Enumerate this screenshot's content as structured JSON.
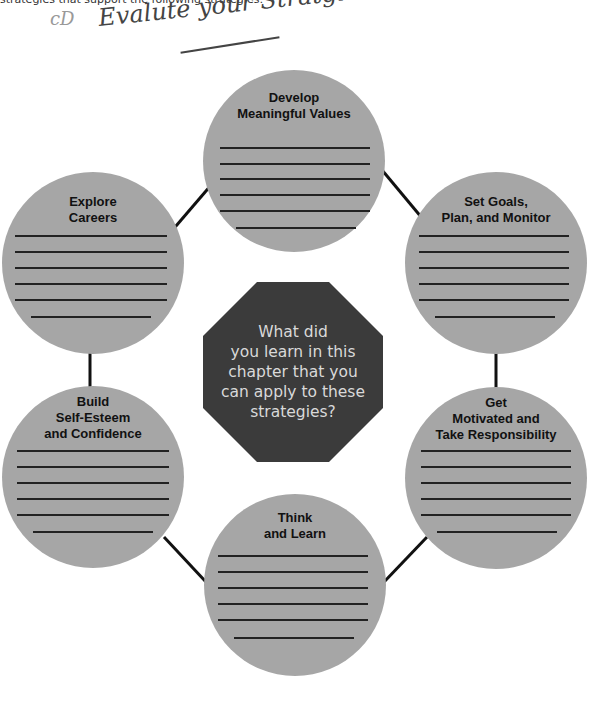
{
  "header": {
    "cutoff_text": "strategies that support the following strategies:",
    "handwritten_mark": "cD",
    "handwritten_note": "Evalute your Stratgies"
  },
  "center": {
    "question_lines": [
      "What did",
      "you learn in this",
      "chapter that you",
      "can apply to these",
      "strategies?"
    ],
    "fill_color": "#3b3b3b",
    "text_color": "#d9d9d9"
  },
  "circle_fill": "#a6a6a6",
  "circles": [
    {
      "id": "develop-meaningful-values",
      "title_lines": [
        "Develop",
        "Meaningful Values"
      ],
      "blank_lines": 6
    },
    {
      "id": "set-goals",
      "title_lines": [
        "Set Goals,",
        "Plan, and Monitor"
      ],
      "blank_lines": 6
    },
    {
      "id": "get-motivated",
      "title_lines": [
        "Get",
        "Motivated and",
        "Take Responsibility"
      ],
      "blank_lines": 6
    },
    {
      "id": "think-and-learn",
      "title_lines": [
        "Think",
        "and Learn"
      ],
      "blank_lines": 6
    },
    {
      "id": "build-self-esteem",
      "title_lines": [
        "Build",
        "Self-Esteem",
        "and Confidence"
      ],
      "blank_lines": 6
    },
    {
      "id": "explore-careers",
      "title_lines": [
        "Explore",
        "Careers"
      ],
      "blank_lines": 6
    }
  ]
}
